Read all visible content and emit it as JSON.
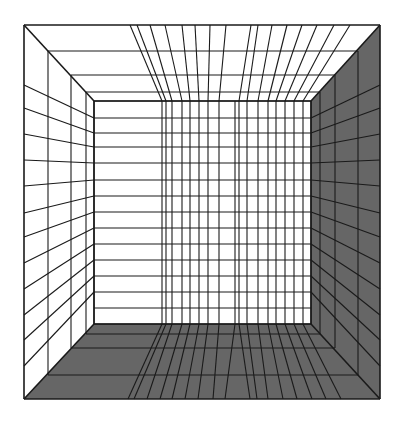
{
  "figure": {
    "width": 402,
    "height": 425
  },
  "colors": {
    "background": "#ffffff",
    "line": "#1a1a1a",
    "light_face": "#ffffff",
    "shaded_face": "#666666"
  },
  "geometry": {
    "outer": {
      "left": 24,
      "top": 25,
      "right": 380,
      "bottom": 399
    },
    "inner": {
      "left": 94,
      "top": 101,
      "right": 311,
      "bottom": 324
    },
    "frame_levels": [
      {
        "left": 24,
        "top": 25,
        "right": 380,
        "bottom": 399
      },
      {
        "left": 48,
        "top": 51,
        "right": 358,
        "bottom": 375
      },
      {
        "left": 71,
        "top": 75,
        "right": 335,
        "bottom": 348
      },
      {
        "left": 86,
        "top": 92,
        "right": 320,
        "bottom": 334
      },
      {
        "left": 94,
        "top": 101,
        "right": 311,
        "bottom": 324
      }
    ],
    "back_wall_vertical_x": [
      162,
      166,
      172,
      182,
      190,
      199,
      208,
      219,
      235,
      239,
      247,
      258,
      268,
      276,
      285,
      294,
      303
    ],
    "back_wall_horizontal_y": [
      118,
      133,
      147,
      163,
      180,
      196,
      212,
      228,
      244,
      260,
      276,
      292,
      308
    ],
    "ceiling_outer_x": [
      130,
      137,
      150,
      165,
      182,
      195,
      210,
      226,
      251,
      258,
      272,
      287,
      302,
      317,
      334,
      350
    ],
    "floor_outer_x": [
      128,
      134,
      147,
      160,
      172,
      185,
      198,
      213,
      225,
      250,
      257,
      268,
      283,
      297,
      312,
      326,
      341
    ],
    "side_wall_outer_y": [
      85,
      108,
      134,
      160,
      186,
      213,
      237,
      263,
      289,
      315,
      340,
      366
    ],
    "side_wall_inner_y": [
      118,
      133,
      147,
      163,
      180,
      196,
      212,
      228,
      244,
      260,
      276,
      292
    ]
  },
  "faces": {
    "ceiling": "light",
    "left_wall": "light",
    "back_wall": "light",
    "right_wall": "shaded",
    "floor": "shaded"
  }
}
